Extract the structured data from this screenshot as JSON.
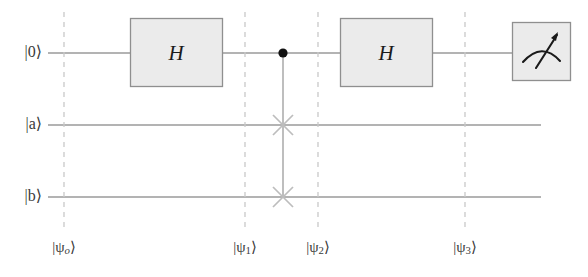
{
  "diagram": {
    "width": 588,
    "height": 277,
    "background_color": "#ffffff"
  },
  "colors": {
    "wire": "#9a9a9a",
    "dashed_separator": "#c9c9c9",
    "gate_fill": "#ebebeb",
    "gate_border": "#8f8f8f",
    "control_dot": "#111111",
    "control_line": "#a8a8a8",
    "swap_marker": "#bdbdbd",
    "text": "#3a3a3a",
    "gate_text": "#1a1a1a"
  },
  "wires": [
    {
      "name": "control-qubit",
      "label": "|0⟩",
      "ket_inner": "0",
      "y": 53
    },
    {
      "name": "register-a",
      "label": "|a⟩",
      "ket_inner": "a",
      "y": 125
    },
    {
      "name": "register-b",
      "label": "|b⟩",
      "ket_inner": "b",
      "y": 197
    }
  ],
  "gates": [
    {
      "id": "hadamard-1",
      "type": "single-qubit-box",
      "label": "H",
      "wire": "control-qubit",
      "x": 130,
      "y": 18,
      "width": 92,
      "height": 68
    },
    {
      "id": "controlled-swap",
      "type": "controlled-swap",
      "label": "CSWAP",
      "control_wire": "control-qubit",
      "target_wires": [
        "register-a",
        "register-b"
      ],
      "x": 283,
      "control_y": 53,
      "target_y_1": 125,
      "target_y_2": 197,
      "control_dot_radius": 4.5,
      "swap_marker_radius": 11
    },
    {
      "id": "hadamard-2",
      "type": "single-qubit-box",
      "label": "H",
      "wire": "control-qubit",
      "x": 340,
      "y": 18,
      "width": 92,
      "height": 68
    },
    {
      "id": "measurement",
      "type": "measurement-meter",
      "label": "measure",
      "wire": "control-qubit",
      "x": 512,
      "y": 22,
      "width": 58,
      "height": 58
    }
  ],
  "separators": [
    {
      "id": "sep-0",
      "x": 64,
      "label": "|ψ",
      "subscript": "o",
      "label_close": "⟩",
      "full": "|ψo⟩",
      "top": 12,
      "bottom": 228
    },
    {
      "id": "sep-1",
      "x": 245,
      "label": "|ψ",
      "subscript": "1",
      "label_close": "⟩",
      "full": "|ψ1⟩",
      "top": 12,
      "bottom": 228
    },
    {
      "id": "sep-2",
      "x": 318,
      "label": "|ψ",
      "subscript": "2",
      "label_close": "⟩",
      "full": "|ψ2⟩",
      "top": 12,
      "bottom": 228
    },
    {
      "id": "sep-3",
      "x": 465,
      "label": "|ψ",
      "subscript": "3",
      "label_close": "⟩",
      "full": "|ψ3⟩",
      "top": 12,
      "bottom": 228
    }
  ],
  "wire_extent": {
    "start_x": 48,
    "end_x_control": 512,
    "end_x_registers": 541
  }
}
